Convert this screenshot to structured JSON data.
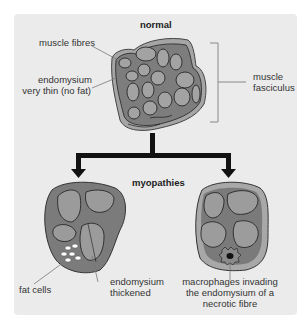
{
  "diagram": {
    "top_title": "normal",
    "bottom_title": "myopathies",
    "labels": {
      "muscle_fibres": "muscle fibres",
      "endomysium_thin_1": "endomysium",
      "endomysium_thin_2": "very thin (no fat)",
      "fasciculus_1": "muscle",
      "fasciculus_2": "fasciculus",
      "fat_cells": "fat cells",
      "endomysium_thick_1": "endomysium",
      "endomysium_thick_2": "thickened",
      "macrophages_1": "macrophages invading",
      "macrophages_2": "the endomysium of a",
      "macrophages_3": "necrotic fibre"
    },
    "colors": {
      "background": "#ebebeb",
      "fascicle_outer": "#7a7a7a",
      "fascicle_rim": "#a8a8a8",
      "fibre": "#9a9a9a",
      "line": "#1a1a1a",
      "leader": "#777777"
    }
  }
}
